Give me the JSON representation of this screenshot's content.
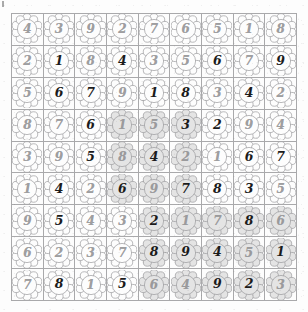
{
  "puzzle": {
    "title": "Flower Sudoku Grid",
    "type": "sudoku",
    "size": 9,
    "cell_glyph": "flower-icon",
    "digit_styles": [
      "light",
      "bold"
    ],
    "colors": {
      "grid_line": "#a9a9ab",
      "digit_light": "#8e8e90",
      "digit_bold": "#1b1b1b",
      "flower_outline": "#9b9b9d",
      "flower_fill_plain": "#fdfdfd",
      "flower_fill_shaded": "#e4e4e4",
      "page_background": "#ffffff"
    },
    "rows": [
      [
        {
          "value": "4",
          "weight": "light",
          "shaded": false
        },
        {
          "value": "3",
          "weight": "light",
          "shaded": false
        },
        {
          "value": "9",
          "weight": "light",
          "shaded": false
        },
        {
          "value": "2",
          "weight": "light",
          "shaded": false
        },
        {
          "value": "7",
          "weight": "light",
          "shaded": false
        },
        {
          "value": "6",
          "weight": "light",
          "shaded": false
        },
        {
          "value": "5",
          "weight": "light",
          "shaded": false
        },
        {
          "value": "1",
          "weight": "light",
          "shaded": false
        },
        {
          "value": "8",
          "weight": "light",
          "shaded": false
        }
      ],
      [
        {
          "value": "2",
          "weight": "light",
          "shaded": false
        },
        {
          "value": "1",
          "weight": "bold",
          "shaded": false
        },
        {
          "value": "8",
          "weight": "light",
          "shaded": false
        },
        {
          "value": "4",
          "weight": "bold",
          "shaded": false
        },
        {
          "value": "3",
          "weight": "light",
          "shaded": false
        },
        {
          "value": "5",
          "weight": "light",
          "shaded": false
        },
        {
          "value": "6",
          "weight": "bold",
          "shaded": false
        },
        {
          "value": "7",
          "weight": "light",
          "shaded": false
        },
        {
          "value": "9",
          "weight": "bold",
          "shaded": false
        }
      ],
      [
        {
          "value": "5",
          "weight": "light",
          "shaded": false
        },
        {
          "value": "6",
          "weight": "bold",
          "shaded": false
        },
        {
          "value": "7",
          "weight": "bold",
          "shaded": false
        },
        {
          "value": "9",
          "weight": "light",
          "shaded": false
        },
        {
          "value": "1",
          "weight": "bold",
          "shaded": false
        },
        {
          "value": "8",
          "weight": "bold",
          "shaded": false
        },
        {
          "value": "3",
          "weight": "light",
          "shaded": false
        },
        {
          "value": "4",
          "weight": "bold",
          "shaded": false
        },
        {
          "value": "2",
          "weight": "light",
          "shaded": false
        }
      ],
      [
        {
          "value": "8",
          "weight": "light",
          "shaded": false
        },
        {
          "value": "7",
          "weight": "light",
          "shaded": false
        },
        {
          "value": "6",
          "weight": "bold",
          "shaded": false
        },
        {
          "value": "1",
          "weight": "light",
          "shaded": true
        },
        {
          "value": "5",
          "weight": "light",
          "shaded": true
        },
        {
          "value": "3",
          "weight": "bold",
          "shaded": true
        },
        {
          "value": "2",
          "weight": "bold",
          "shaded": false
        },
        {
          "value": "9",
          "weight": "light",
          "shaded": false
        },
        {
          "value": "4",
          "weight": "light",
          "shaded": false
        }
      ],
      [
        {
          "value": "3",
          "weight": "light",
          "shaded": false
        },
        {
          "value": "9",
          "weight": "light",
          "shaded": false
        },
        {
          "value": "5",
          "weight": "bold",
          "shaded": false
        },
        {
          "value": "8",
          "weight": "light",
          "shaded": true
        },
        {
          "value": "4",
          "weight": "bold",
          "shaded": true
        },
        {
          "value": "2",
          "weight": "light",
          "shaded": true
        },
        {
          "value": "1",
          "weight": "light",
          "shaded": false
        },
        {
          "value": "6",
          "weight": "bold",
          "shaded": false
        },
        {
          "value": "7",
          "weight": "bold",
          "shaded": false
        }
      ],
      [
        {
          "value": "1",
          "weight": "light",
          "shaded": false
        },
        {
          "value": "4",
          "weight": "bold",
          "shaded": false
        },
        {
          "value": "2",
          "weight": "light",
          "shaded": false
        },
        {
          "value": "6",
          "weight": "bold",
          "shaded": true
        },
        {
          "value": "9",
          "weight": "light",
          "shaded": true
        },
        {
          "value": "7",
          "weight": "bold",
          "shaded": true
        },
        {
          "value": "8",
          "weight": "bold",
          "shaded": false
        },
        {
          "value": "3",
          "weight": "bold",
          "shaded": false
        },
        {
          "value": "5",
          "weight": "light",
          "shaded": false
        }
      ],
      [
        {
          "value": "9",
          "weight": "light",
          "shaded": false
        },
        {
          "value": "5",
          "weight": "bold",
          "shaded": false
        },
        {
          "value": "4",
          "weight": "light",
          "shaded": false
        },
        {
          "value": "3",
          "weight": "light",
          "shaded": false
        },
        {
          "value": "2",
          "weight": "bold",
          "shaded": true
        },
        {
          "value": "1",
          "weight": "light",
          "shaded": true
        },
        {
          "value": "7",
          "weight": "light",
          "shaded": true
        },
        {
          "value": "8",
          "weight": "bold",
          "shaded": true
        },
        {
          "value": "6",
          "weight": "light",
          "shaded": true
        }
      ],
      [
        {
          "value": "6",
          "weight": "light",
          "shaded": false
        },
        {
          "value": "2",
          "weight": "light",
          "shaded": false
        },
        {
          "value": "3",
          "weight": "light",
          "shaded": false
        },
        {
          "value": "7",
          "weight": "light",
          "shaded": false
        },
        {
          "value": "8",
          "weight": "bold",
          "shaded": true
        },
        {
          "value": "9",
          "weight": "bold",
          "shaded": true
        },
        {
          "value": "4",
          "weight": "bold",
          "shaded": true
        },
        {
          "value": "5",
          "weight": "light",
          "shaded": true
        },
        {
          "value": "1",
          "weight": "bold",
          "shaded": true
        }
      ],
      [
        {
          "value": "7",
          "weight": "light",
          "shaded": false
        },
        {
          "value": "8",
          "weight": "bold",
          "shaded": false
        },
        {
          "value": "1",
          "weight": "light",
          "shaded": false
        },
        {
          "value": "5",
          "weight": "bold",
          "shaded": false
        },
        {
          "value": "6",
          "weight": "light",
          "shaded": true
        },
        {
          "value": "4",
          "weight": "light",
          "shaded": true
        },
        {
          "value": "9",
          "weight": "bold",
          "shaded": true
        },
        {
          "value": "2",
          "weight": "bold",
          "shaded": true
        },
        {
          "value": "3",
          "weight": "light",
          "shaded": true
        }
      ]
    ]
  }
}
